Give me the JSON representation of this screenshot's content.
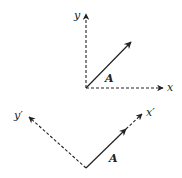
{
  "figure": {
    "colors": {
      "stroke": "#222222",
      "background": "#ffffff"
    },
    "top_frame": {
      "origin": [
        86,
        88
      ],
      "x_axis": {
        "label": "x",
        "end": [
          163,
          88
        ],
        "style": "dashed"
      },
      "y_axis": {
        "label": "y",
        "end": [
          86,
          14
        ],
        "style": "dashed"
      },
      "vector": {
        "label": "A",
        "end": [
          131,
          42
        ],
        "style": "solid"
      }
    },
    "bottom_frame": {
      "origin": [
        86,
        168
      ],
      "x_axis": {
        "label": "x′",
        "end": [
          142,
          114
        ],
        "style": "dashed"
      },
      "y_axis": {
        "label": "y′",
        "end": [
          29,
          117
        ],
        "style": "dashed"
      },
      "vector": {
        "label": "A",
        "end": [
          126,
          129
        ],
        "style": "solid"
      }
    }
  }
}
